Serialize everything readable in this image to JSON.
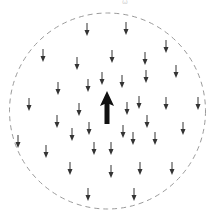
{
  "diagram": {
    "top_label": "ω",
    "boundary": {
      "shape": "circle",
      "style": "dashed",
      "color": "#9a9a9a",
      "cx": 107.5,
      "cy": 111,
      "r": 98
    },
    "main_arrow": {
      "direction": "up",
      "x": 107,
      "y_tip": 91,
      "y_base": 124,
      "color": "#111111"
    },
    "small_arrows": {
      "direction": "down",
      "length": 13,
      "color": "#333333",
      "positions": [
        [
          87,
          23
        ],
        [
          126,
          22
        ],
        [
          166,
          40
        ],
        [
          43,
          49
        ],
        [
          112,
          50
        ],
        [
          145,
          52
        ],
        [
          77,
          57
        ],
        [
          176,
          65
        ],
        [
          102,
          72
        ],
        [
          146,
          70
        ],
        [
          122,
          75
        ],
        [
          88,
          79
        ],
        [
          58,
          82
        ],
        [
          139,
          96
        ],
        [
          166,
          97
        ],
        [
          198,
          97
        ],
        [
          29,
          98
        ],
        [
          127,
          102
        ],
        [
          79,
          103
        ],
        [
          147,
          115
        ],
        [
          57,
          115
        ],
        [
          89,
          122
        ],
        [
          183,
          122
        ],
        [
          123,
          125
        ],
        [
          72,
          128
        ],
        [
          133,
          132
        ],
        [
          155,
          132
        ],
        [
          18,
          135
        ],
        [
          111,
          142
        ],
        [
          94,
          142
        ],
        [
          46,
          145
        ],
        [
          140,
          162
        ],
        [
          172,
          162
        ],
        [
          70,
          162
        ],
        [
          111,
          165
        ],
        [
          88,
          188
        ],
        [
          134,
          188
        ]
      ]
    }
  }
}
